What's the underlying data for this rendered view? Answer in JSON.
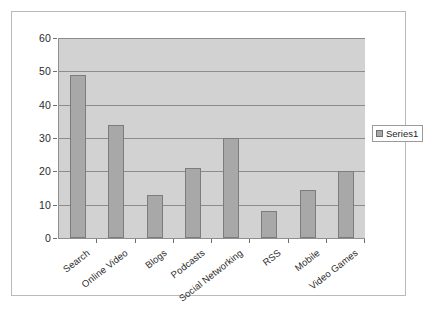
{
  "chart_data": {
    "type": "bar",
    "title": "",
    "subtitle": "",
    "xlabel": "",
    "ylabel": "",
    "ylim": [
      0,
      60
    ],
    "ytick_step": 10,
    "yticks": [
      "0",
      "10",
      "20",
      "30",
      "40",
      "50",
      "60"
    ],
    "categories": [
      "Search",
      "Online Video",
      "Blogs",
      "Podcasts",
      "Social Networking",
      "RSS",
      "Mobile",
      "Video Games"
    ],
    "values": [
      49,
      34,
      13,
      21,
      30,
      8,
      14.5,
      20
    ],
    "series": [
      {
        "name": "Series1",
        "values": [
          49,
          34,
          13,
          21,
          30,
          8,
          14.5,
          20
        ]
      }
    ],
    "grid": true,
    "grid_axis": "y",
    "legend": {
      "position": "right",
      "entries": [
        "Series1"
      ]
    },
    "colors": {
      "bar_fill": "#a8a8a8",
      "bar_border": "#7c7c7c",
      "plot_background": "#d2d2d2",
      "gridline": "#8c8c8c",
      "axis": "#8f8f8f",
      "text": "#2b2b2b",
      "frame_border": "#b9b9b9",
      "page_background": "#ffffff"
    }
  },
  "legend": {
    "series1_label": "Series1"
  }
}
